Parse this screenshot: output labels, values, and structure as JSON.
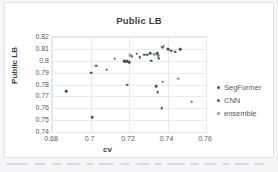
{
  "chart_data": {
    "type": "scatter",
    "title": "Public LB",
    "xlabel": "cv",
    "ylabel": "Public LB",
    "xlim": [
      0.68,
      0.76
    ],
    "ylim": [
      0.74,
      0.82
    ],
    "xticks": [
      "0.68",
      "0.7",
      "0.72",
      "0.74",
      "0.76"
    ],
    "xtick_values": [
      0.68,
      0.7,
      0.72,
      0.74,
      0.76
    ],
    "yticks": [
      "0.82",
      "0.81",
      "0.8",
      "0.79",
      "0.78",
      "0.77",
      "0.76",
      "0.75",
      "0.74"
    ],
    "ytick_values": [
      0.82,
      0.81,
      0.8,
      0.79,
      0.78,
      0.77,
      0.76,
      0.75,
      0.74
    ],
    "grid": true,
    "legend_position": "right",
    "series": [
      {
        "name": "SegFormer",
        "color": "#4a5058",
        "points": [
          [
            0.6875,
            0.7745
          ],
          [
            0.7005,
            0.79
          ],
          [
            0.703,
            0.7958
          ],
          [
            0.7085,
            0.7923
          ],
          [
            0.7125,
            0.8018
          ],
          [
            0.7175,
            0.7995
          ],
          [
            0.718,
            0.7997
          ],
          [
            0.719,
            0.7997
          ],
          [
            0.72,
            0.799
          ],
          [
            0.7215,
            0.804
          ],
          [
            0.724,
            0.8058
          ],
          [
            0.7255,
            0.8028
          ],
          [
            0.728,
            0.805
          ],
          [
            0.7295,
            0.8052
          ],
          [
            0.731,
            0.8062
          ],
          [
            0.7315,
            0.8
          ],
          [
            0.7345,
            0.8062
          ],
          [
            0.735,
            0.8045
          ],
          [
            0.7355,
            0.802
          ],
          [
            0.737,
            0.812
          ],
          [
            0.7375,
            0.811
          ],
          [
            0.74,
            0.81
          ],
          [
            0.7405,
            0.8098
          ],
          [
            0.742,
            0.8085
          ],
          [
            0.744,
            0.8075
          ],
          [
            0.7465,
            0.8098
          ]
        ]
      },
      {
        "name": "CNN",
        "color": "#565b63",
        "points": [
          [
            0.701,
            0.7523
          ],
          [
            0.719,
            0.78
          ],
          [
            0.734,
            0.7785
          ],
          [
            0.735,
            0.7737
          ],
          [
            0.737,
            0.76
          ],
          [
            0.7375,
            0.7825
          ],
          [
            0.7525,
            0.7655
          ]
        ]
      },
      {
        "name": "ensemble",
        "color": "#8d939b",
        "points": [
          [
            0.7205,
            0.8045
          ],
          [
            0.733,
            0.8055
          ],
          [
            0.7355,
            0.8048
          ],
          [
            0.738,
            0.8125
          ],
          [
            0.7455,
            0.7848
          ]
        ]
      }
    ]
  },
  "legend": {
    "items": [
      {
        "label": "SegFormer",
        "color": "#4a5058"
      },
      {
        "label": "CNN",
        "color": "#565b63"
      },
      {
        "label": "ensemble",
        "color": "#8d939b"
      }
    ]
  }
}
